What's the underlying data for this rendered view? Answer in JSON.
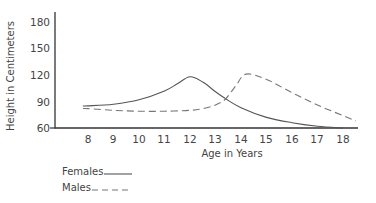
{
  "chart_data": {
    "type": "line",
    "title": "",
    "xlabel": "Age in Years",
    "ylabel": "Height in Centimeters",
    "xlim": [
      7.5,
      18.5
    ],
    "ylim": [
      60,
      180
    ],
    "x_ticks": [
      8,
      9,
      10,
      11,
      12,
      13,
      14,
      15,
      16,
      17,
      18
    ],
    "y_ticks": [
      60,
      90,
      120,
      150,
      180
    ],
    "grid": false,
    "legend_position": "bottom-left",
    "series": [
      {
        "name": "Females",
        "style": "solid",
        "color": "#555555",
        "x": [
          7.8,
          8,
          9,
          10,
          11,
          11.5,
          12,
          12.5,
          13,
          13.4,
          14,
          15,
          16,
          17,
          18
        ],
        "y": [
          85,
          85,
          87,
          92,
          102,
          110,
          118,
          112,
          101,
          93,
          83,
          72,
          66,
          62,
          60
        ]
      },
      {
        "name": "Males",
        "style": "dashed",
        "color": "#777777",
        "x": [
          7.8,
          8,
          9,
          10,
          11,
          12,
          12.5,
          13,
          13.4,
          13.8,
          14.2,
          15,
          16,
          17,
          18,
          18.5
        ],
        "y": [
          82,
          82,
          80,
          79,
          79,
          80,
          82,
          86,
          93,
          108,
          121,
          115,
          100,
          86,
          74,
          68
        ]
      }
    ]
  },
  "axes": {
    "x_label": "Age in Years",
    "y_label": "Height in Centimeters",
    "x_tick_labels": [
      "8",
      "9",
      "10",
      "11",
      "12",
      "13",
      "14",
      "15",
      "16",
      "17",
      "18"
    ],
    "y_tick_labels": [
      "180",
      "150",
      "120",
      "90",
      "60"
    ]
  },
  "legend": {
    "females_label": "Females",
    "males_label": "Males"
  }
}
